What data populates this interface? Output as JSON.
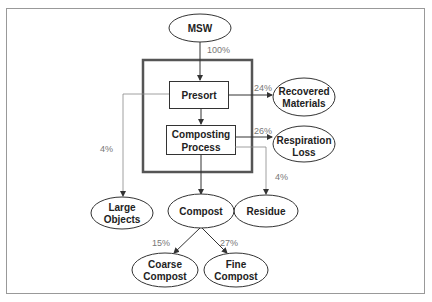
{
  "diagram": {
    "nodes": {
      "msw": {
        "label": "MSW"
      },
      "presort": {
        "label": "Presort"
      },
      "composting_1": {
        "label": "Composting"
      },
      "composting_2": {
        "label": "Process"
      },
      "recovered_1": {
        "label": "Recovered"
      },
      "recovered_2": {
        "label": "Materials"
      },
      "respiration_1": {
        "label": "Respiration"
      },
      "respiration_2": {
        "label": "Loss"
      },
      "large_1": {
        "label": "Large"
      },
      "large_2": {
        "label": "Objects"
      },
      "compost": {
        "label": "Compost"
      },
      "residue": {
        "label": "Residue"
      },
      "coarse_1": {
        "label": "Coarse"
      },
      "coarse_2": {
        "label": "Compost"
      },
      "fine_1": {
        "label": "Fine"
      },
      "fine_2": {
        "label": "Compost"
      }
    },
    "flows": {
      "msw_in": "100%",
      "recovered": "24%",
      "respiration": "26%",
      "large_objects": "4%",
      "residue": "4%",
      "coarse": "15%",
      "fine": "27%"
    },
    "colors": {
      "line": "#333333",
      "frame": "#999999",
      "thick_box": "#555555",
      "pct_text": "#777777"
    }
  }
}
